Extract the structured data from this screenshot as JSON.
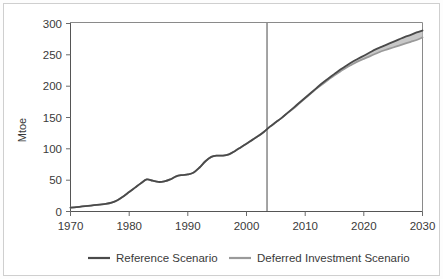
{
  "chart_data": {
    "type": "line",
    "title": "",
    "subtitle": "",
    "xlabel": "",
    "ylabel": "Mtoe",
    "xlim": [
      1970,
      2030
    ],
    "ylim": [
      0,
      300
    ],
    "xticks": [
      1970,
      1980,
      1990,
      2000,
      2010,
      2020,
      2030
    ],
    "yticks": [
      0,
      50,
      100,
      150,
      200,
      250,
      300
    ],
    "grid": false,
    "legend_position": "bottom",
    "annotations": [
      {
        "name": "projection-divider",
        "type": "vline",
        "x": 2003.5
      }
    ],
    "x": [
      1970,
      1971,
      1972,
      1973,
      1974,
      1975,
      1976,
      1977,
      1978,
      1979,
      1980,
      1981,
      1982,
      1983,
      1984,
      1985,
      1986,
      1987,
      1988,
      1989,
      1990,
      1991,
      1992,
      1993,
      1994,
      1995,
      1996,
      1997,
      1998,
      1999,
      2000,
      2001,
      2002,
      2003,
      2004,
      2005,
      2006,
      2007,
      2008,
      2009,
      2010,
      2011,
      2012,
      2013,
      2014,
      2015,
      2016,
      2017,
      2018,
      2019,
      2020,
      2021,
      2022,
      2023,
      2024,
      2025,
      2026,
      2027,
      2028,
      2029,
      2030
    ],
    "series": [
      {
        "name": "Reference Scenario",
        "color": "#4a4a4a",
        "values": [
          6,
          7,
          8,
          9,
          10,
          11,
          12,
          14,
          18,
          24,
          31,
          38,
          45,
          51,
          49,
          47,
          48,
          51,
          56,
          58,
          59,
          62,
          70,
          80,
          87,
          89,
          89,
          91,
          96,
          102,
          108,
          114,
          120,
          127,
          135,
          142,
          149,
          157,
          165,
          173,
          181,
          189,
          197,
          205,
          212,
          219,
          226,
          232,
          238,
          243,
          248,
          253,
          258,
          262,
          266,
          270,
          274,
          278,
          281,
          285,
          288
        ]
      },
      {
        "name": "Deferred Investment Scenario",
        "color": "#9a9a9a",
        "values": [
          6,
          7,
          8,
          9,
          10,
          11,
          12,
          14,
          18,
          24,
          31,
          38,
          45,
          51,
          49,
          47,
          48,
          51,
          56,
          58,
          59,
          62,
          70,
          80,
          87,
          89,
          89,
          91,
          96,
          102,
          108,
          114,
          120,
          127,
          135,
          142,
          149,
          157,
          164,
          172,
          180,
          188,
          196,
          203,
          210,
          217,
          223,
          229,
          234,
          239,
          243,
          247,
          251,
          255,
          258,
          261,
          264,
          267,
          270,
          273,
          277
        ]
      }
    ]
  },
  "axes": {
    "y_title": "Mtoe",
    "y_tick_labels": [
      "0",
      "50",
      "100",
      "150",
      "200",
      "250",
      "300"
    ],
    "x_tick_labels": [
      "1970",
      "1980",
      "1990",
      "2000",
      "2010",
      "2020",
      "2030"
    ]
  },
  "legend": {
    "items": [
      {
        "label": "Reference Scenario",
        "color": "#4a4a4a"
      },
      {
        "label": "Deferred Investment Scenario",
        "color": "#9a9a9a"
      }
    ]
  }
}
